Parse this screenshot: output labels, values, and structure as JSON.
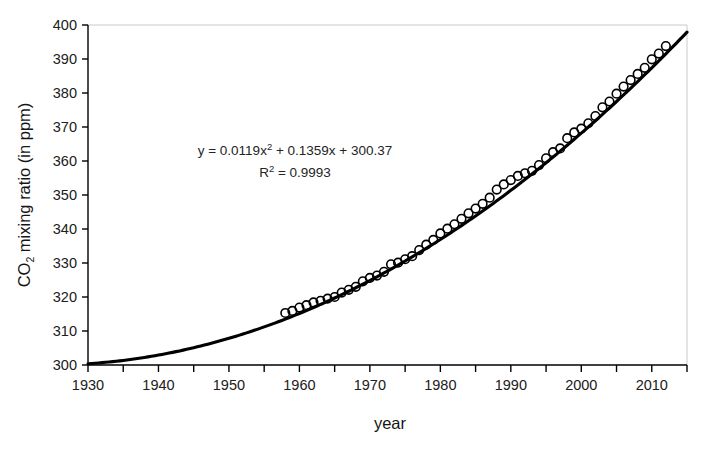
{
  "chart_data": {
    "type": "scatter",
    "title": "",
    "xlabel": "year",
    "ylabel": "CO2 mixing ratio (in ppm)",
    "ylabel_parts": {
      "pre": "CO",
      "sub": "2",
      "post": " mixing ratio (in ppm)"
    },
    "xlim": [
      1930,
      2015
    ],
    "ylim": [
      300,
      400
    ],
    "xticks": [
      1930,
      1940,
      1950,
      1960,
      1970,
      1980,
      1990,
      2000,
      2010
    ],
    "xticks_minor": [
      1935,
      1945,
      1955,
      1965,
      1975,
      1985,
      1995,
      2005,
      2015
    ],
    "yticks": [
      300,
      310,
      320,
      330,
      340,
      350,
      360,
      370,
      380,
      390,
      400
    ],
    "grid": false,
    "legend": "none",
    "marker": "open-circle",
    "marker_color": "#000000",
    "line_color": "#000000",
    "annotations": {
      "equation": {
        "pre": "y = 0.0119x",
        "sup": "2",
        "post": " + 0.1359x + 300.37"
      },
      "r_squared": {
        "pre": "R",
        "sup": "2",
        "post": " = 0.9993"
      }
    },
    "series": [
      {
        "name": "CO2 observations",
        "x": [
          1958,
          1959,
          1960,
          1961,
          1962,
          1963,
          1964,
          1965,
          1966,
          1967,
          1968,
          1969,
          1970,
          1971,
          1972,
          1973,
          1974,
          1975,
          1976,
          1977,
          1978,
          1979,
          1980,
          1981,
          1982,
          1983,
          1984,
          1985,
          1986,
          1987,
          1988,
          1989,
          1990,
          1991,
          1992,
          1993,
          1994,
          1995,
          1996,
          1997,
          1998,
          1999,
          2000,
          2001,
          2002,
          2003,
          2004,
          2005,
          2006,
          2007,
          2008,
          2009,
          2010,
          2011,
          2012
        ],
        "values": [
          315.3,
          315.9,
          316.9,
          317.6,
          318.4,
          318.9,
          319.5,
          320.0,
          321.3,
          322.1,
          323.0,
          324.6,
          325.6,
          326.3,
          327.4,
          329.6,
          330.1,
          331.1,
          332.0,
          333.8,
          335.4,
          336.8,
          338.7,
          340.1,
          341.4,
          343.0,
          344.6,
          346.0,
          347.4,
          349.2,
          351.6,
          353.1,
          354.4,
          355.6,
          356.4,
          357.1,
          358.8,
          360.8,
          362.6,
          363.7,
          366.7,
          368.4,
          369.5,
          371.1,
          373.2,
          375.8,
          377.5,
          379.8,
          381.9,
          383.8,
          385.6,
          387.4,
          389.9,
          391.6,
          393.8
        ]
      }
    ],
    "fit": {
      "type": "polynomial-order-2",
      "equation": "y = 0.0119x^2 + 0.1359x + 300.37",
      "r_squared": 0.9993,
      "a": 0.0119,
      "b": 0.1359,
      "c": 300.37,
      "x_origin": 1930,
      "x_start": 1930,
      "x_end": 2015
    },
    "axis_color": "#000000",
    "frame_color": "#bfbfbf"
  }
}
